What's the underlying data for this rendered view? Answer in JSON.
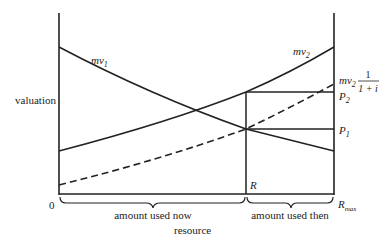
{
  "axes": {
    "y_label": "valuation",
    "x_label": "resource",
    "origin_label": "0"
  },
  "curves": {
    "mv1": {
      "name": "mv",
      "sub": "1"
    },
    "mv2": {
      "name": "mv",
      "sub": "2"
    },
    "mv2_discounted": {
      "name": "mv",
      "sub": "2",
      "frac_num": "1",
      "frac_den": "1 + i"
    }
  },
  "prices": {
    "p2": {
      "name": "P",
      "sub": "2"
    },
    "p1": {
      "name": "P",
      "sub": "1"
    }
  },
  "markers": {
    "r": "R",
    "rmax": {
      "name": "R",
      "sub": "max"
    }
  },
  "braces": {
    "now": "amount used now",
    "then": "amount used then"
  },
  "colors": {
    "line": "#222222",
    "background": "#ffffff"
  }
}
